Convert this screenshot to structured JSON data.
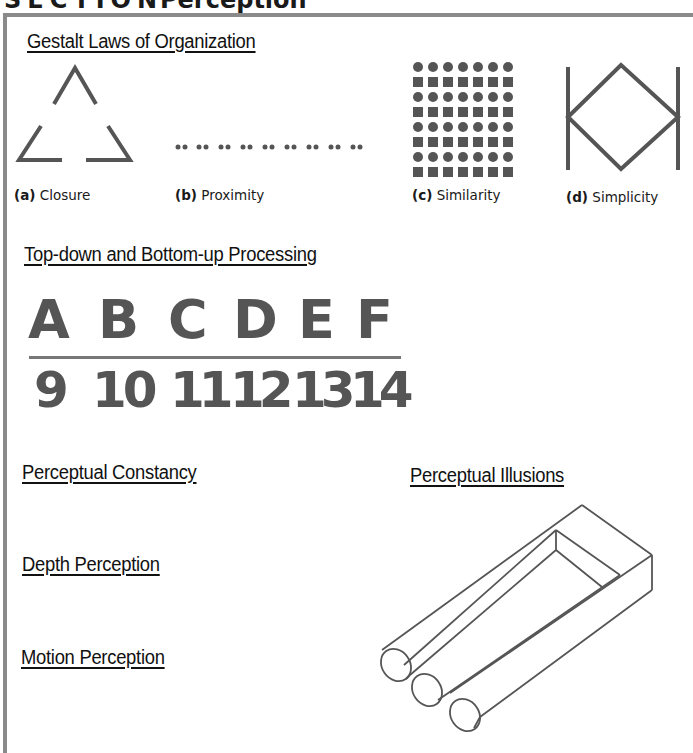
{
  "page": {
    "title_prefix": "SECTION",
    "title": "Perception",
    "frame_color": "#8a8a8a",
    "ink_color": "#555555"
  },
  "gestalt": {
    "heading": "Gestalt Laws of Organization",
    "figures": [
      {
        "letter": "(a)",
        "label": "Closure",
        "icon": "incomplete-triangle"
      },
      {
        "letter": "(b)",
        "label": "Proximity",
        "icon": "paired-dots-row"
      },
      {
        "letter": "(c)",
        "label": "Similarity",
        "icon": "circle-square-grid"
      },
      {
        "letter": "(d)",
        "label": "Simplicity",
        "icon": "diamond-between-bars"
      }
    ]
  },
  "processing": {
    "heading": "Top-down and Bottom-up Processing",
    "letters": [
      "A",
      "B",
      "C",
      "D",
      "E",
      "F"
    ],
    "numbers": [
      "9",
      "10",
      "11",
      "12",
      "13",
      "14"
    ]
  },
  "topics": [
    {
      "heading": "Perceptual Constancy"
    },
    {
      "heading": "Depth Perception"
    },
    {
      "heading": "Motion Perception"
    }
  ],
  "illusions": {
    "heading": "Perceptual Illusions",
    "icon": "impossible-trident"
  }
}
